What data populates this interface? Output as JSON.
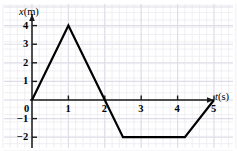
{
  "figure": {
    "name": "position-time-graph",
    "background": "#ffffff",
    "line_color": "#000000",
    "axis_color": "#1a1a1a",
    "grid_color": "#e9e9ef",
    "grid_color_major": "#dedee8"
  },
  "axes": {
    "y": {
      "variable": "x",
      "unit": "(m)",
      "label": "x(m)",
      "ticks": [
        "4",
        "3",
        "2",
        "1",
        "0",
        "−1",
        "−2"
      ],
      "tick_values": [
        4,
        3,
        2,
        1,
        0,
        -1,
        -2
      ],
      "range": [
        -3,
        4.6
      ]
    },
    "x": {
      "variable": "t",
      "unit": "(s)",
      "label": "t(s)",
      "ticks": [
        "1",
        "2",
        "3",
        "4",
        "5"
      ],
      "tick_values": [
        1,
        2,
        3,
        4,
        5
      ],
      "origin_label": "0",
      "range": [
        -0.25,
        5.6
      ]
    }
  },
  "chart_data": {
    "type": "line",
    "title": "",
    "subtitle": "",
    "xlabel": "t(s)",
    "ylabel": "x(m)",
    "xlim": [
      -0.25,
      5.6
    ],
    "ylim": [
      -3,
      4.6
    ],
    "grid": true,
    "legend": null,
    "xticks": [
      0,
      1,
      2,
      3,
      4,
      5
    ],
    "xticklabels": [
      "0",
      "1",
      "2",
      "3",
      "4",
      "5"
    ],
    "yticks": [
      -2,
      -1,
      0,
      1,
      2,
      3,
      4
    ],
    "yticklabels": [
      "−2",
      "−1",
      "0",
      "1",
      "2",
      "3",
      "4"
    ],
    "series": [
      {
        "name": "position",
        "x": [
          0,
          1,
          2,
          2.5,
          4.2,
          5
        ],
        "y": [
          0,
          4,
          0,
          -2,
          -2,
          0
        ]
      }
    ],
    "annotations": []
  }
}
